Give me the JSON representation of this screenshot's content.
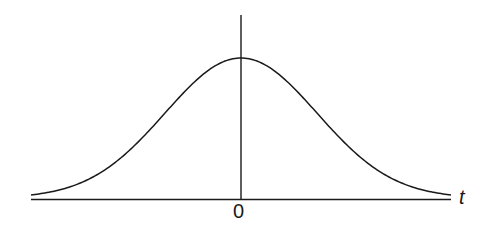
{
  "figure": {
    "type": "bell-curve",
    "axis_labels": {
      "origin": "0",
      "horizontal": "t"
    },
    "colors": {
      "stroke": "#1a1a1a",
      "background": "#ffffff"
    }
  },
  "chart_data": {
    "type": "line",
    "title": "",
    "xlabel": "t",
    "ylabel": "",
    "x_ticks": [
      "0"
    ],
    "grid": false,
    "legend": null,
    "series": [
      {
        "name": "gaussian",
        "description": "Symmetric bell-shaped curve centered at t = 0, approaching the t-axis at both ends",
        "peak": {
          "t": 0,
          "relative_height": 1.0
        }
      }
    ]
  }
}
